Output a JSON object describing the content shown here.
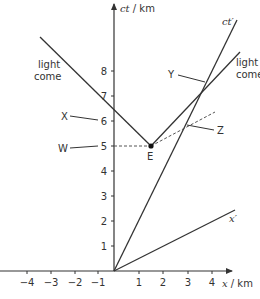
{
  "diagram": {
    "type": "spacetime-diagram",
    "colors": {
      "line": "#333333",
      "dashed": "#555555",
      "background": "#ffffff"
    },
    "axes": {
      "ct_axis_label": "ct",
      "ct_axis_unit": " / km",
      "x_axis_label": "x",
      "x_axis_unit": " / km",
      "ct_prime_label": "ct′",
      "x_prime_label": "x′"
    },
    "x_ticks": [
      "−4",
      "−3",
      "−2",
      "−1",
      "1",
      "2",
      "3",
      "4"
    ],
    "ct_ticks": [
      "1",
      "2",
      "3",
      "4",
      "5",
      "6",
      "7",
      "8"
    ],
    "labels": {
      "light_left_line1": "light",
      "light_left_line2": "come",
      "light_right_line1": "light",
      "light_right_line2": "come",
      "X": "X",
      "W": "W",
      "E": "E",
      "Y": "Y",
      "Z": "Z"
    },
    "event_E": {
      "x_km": 1.5,
      "ct_km": 5
    }
  }
}
